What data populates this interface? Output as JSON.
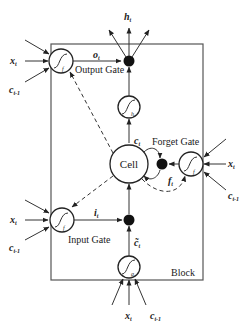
{
  "diagram": {
    "type": "LSTM memory block",
    "block_label": "Block",
    "cell_label": "Cell",
    "gates": {
      "output": {
        "label": "Output Gate",
        "signal": "o",
        "signal_sub": "t",
        "activation": "f"
      },
      "forget": {
        "label": "Forget Gate",
        "signal": "f",
        "signal_sub": "t",
        "activation": "f"
      },
      "input": {
        "label": "Input Gate",
        "signal": "i",
        "signal_sub": "t",
        "activation": "f"
      }
    },
    "candidate": {
      "signal": "c̃",
      "signal_sub": "t",
      "activation": "g"
    },
    "cell_output_activation": "h",
    "cell_state": {
      "signal": "c",
      "signal_sub": "t"
    },
    "output": {
      "signal": "h",
      "signal_sub": "t"
    },
    "inputs": {
      "x": {
        "signal": "x",
        "signal_sub": "t"
      },
      "c_prev": {
        "signal": "c",
        "signal_sub": "t-1"
      }
    }
  }
}
